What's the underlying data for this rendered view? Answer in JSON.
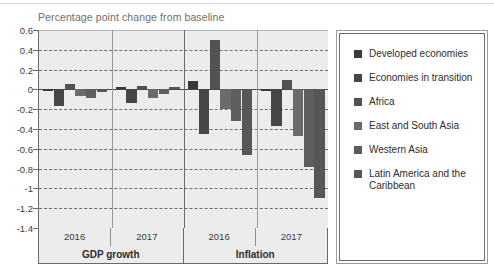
{
  "chart_data": {
    "type": "bar",
    "title": "Percentage point change from baseline",
    "xlabel": "",
    "ylabel": "",
    "ylim": [
      -1.4,
      0.6
    ],
    "ytick_step": 0.2,
    "grid": true,
    "legend_position": "right",
    "yticks": [
      "0.6",
      "0.4",
      "0.2",
      "0",
      "-0.2",
      "-0.4",
      "-0.6",
      "-0.8",
      "-1",
      "-1.2",
      "-1.4"
    ],
    "ytick_values": [
      0.6,
      0.4,
      0.2,
      0,
      -0.2,
      -0.4,
      -0.6,
      -0.8,
      -1,
      -1.2,
      -1.4
    ],
    "groups": [
      {
        "name": "GDP growth",
        "years": [
          "2016",
          "2017"
        ]
      },
      {
        "name": "Inflation",
        "years": [
          "2016",
          "2017"
        ]
      }
    ],
    "categories": [
      "GDP growth 2016",
      "GDP growth 2017",
      "Inflation 2016",
      "Inflation 2017"
    ],
    "series": [
      {
        "name": "Developed economies",
        "color": "#3a3a3a",
        "values": [
          -0.01,
          0.02,
          0.08,
          -0.01
        ]
      },
      {
        "name": "Economies in transition",
        "color": "#464646",
        "values": [
          -0.17,
          -0.14,
          -0.45,
          -0.37
        ]
      },
      {
        "name": "Africa",
        "color": "#525252",
        "values": [
          0.05,
          0.03,
          0.5,
          0.1
        ]
      },
      {
        "name": "East and South Asia",
        "color": "#6b6b6b",
        "values": [
          -0.07,
          -0.09,
          -0.2,
          -0.47
        ]
      },
      {
        "name": "Western Asia",
        "color": "#5e5e5e",
        "values": [
          -0.09,
          -0.05,
          -0.32,
          -0.78
        ]
      },
      {
        "name": "Latin America and the Caribbean",
        "color": "#575757",
        "values": [
          -0.03,
          0.02,
          -0.66,
          -1.1
        ]
      }
    ],
    "legend_entries": [
      {
        "label": "Developed economies",
        "color": "#3a3a3a"
      },
      {
        "label": "Economies in transition",
        "color": "#464646"
      },
      {
        "label": "Africa",
        "color": "#525252"
      },
      {
        "label": "East and South Asia",
        "color": "#6b6b6b"
      },
      {
        "label": "Western Asia",
        "color": "#5e5e5e"
      },
      {
        "label": "Latin America and the Caribbean",
        "color": "#575757"
      }
    ]
  }
}
